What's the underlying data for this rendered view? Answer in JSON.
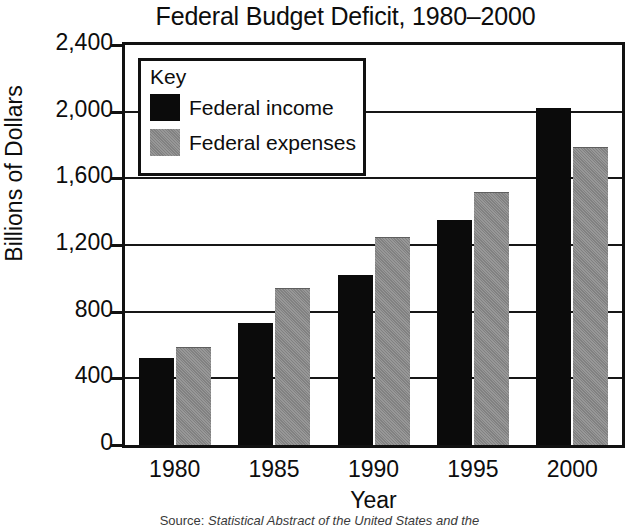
{
  "chart_data": {
    "type": "bar",
    "title": "Federal Budget Deficit, 1980–2000",
    "xlabel": "Year",
    "ylabel": "Billions of Dollars",
    "categories": [
      "1980",
      "1985",
      "1990",
      "1995",
      "2000"
    ],
    "series": [
      {
        "name": "Federal income",
        "color": "#0b0b0b",
        "values": [
          520,
          735,
          1020,
          1350,
          2025
        ]
      },
      {
        "name": "Federal expenses",
        "color": "#8c8c8c",
        "values": [
          590,
          940,
          1250,
          1520,
          1790
        ]
      }
    ],
    "ylim": [
      0,
      2400
    ],
    "ytick_values": [
      0,
      400,
      800,
      1200,
      1600,
      2000,
      2400
    ],
    "ytick_labels": [
      "0",
      "400",
      "800",
      "1,200",
      "1,600",
      "2,000",
      "2,400"
    ],
    "grid": true,
    "legend_position": "top-left-inset",
    "legend_title": "Key"
  },
  "legend": {
    "title": "Key",
    "entries": [
      {
        "label": "Federal income"
      },
      {
        "label": "Federal expenses"
      }
    ]
  },
  "source": {
    "prefix": "Source:",
    "text": "Statistical Abstract of the United States and the"
  }
}
